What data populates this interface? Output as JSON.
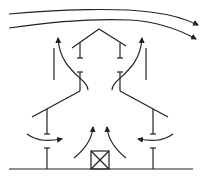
{
  "diagram": {
    "colors": {
      "stroke": "#222222",
      "background": "#ffffff"
    },
    "elements": {
      "wind_arrows": 2,
      "roof": "peaked",
      "side_walls": 2,
      "floor_plates": 2,
      "fan_box": 1,
      "ground_line": 1
    }
  }
}
